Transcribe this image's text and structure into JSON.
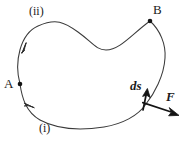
{
  "figure": {
    "background_color": "#ffffff",
    "stroke_color": "#3a3a3a",
    "ink_color": "#1a1a1a",
    "width": 190,
    "height": 142,
    "labels": {
      "point_a": "A",
      "point_b": "B",
      "path_lower": "(i)",
      "path_upper": "(ii)",
      "vector_ds": "ds",
      "vector_force": "F"
    },
    "points": {
      "a": {
        "x": 20,
        "y": 84
      },
      "b": {
        "x": 150,
        "y": 21
      }
    },
    "geometry": {
      "upper_path": "M 20 84 C 14 62 20 34 38 26 C 56 18 64 22 78 32 C 92 42 96 50 106 50 C 120 50 132 34 150 21",
      "lower_path": "M 20 84 C 22 98 26 112 40 120 C 60 131 84 130 104 127 C 122 124 138 116 146 104",
      "right_path": "M 150 21 C 160 30 166 44 165 58 C 164 76 154 94 146 104",
      "arrow_upper_tip": {
        "x": 26,
        "y": 44
      },
      "arrow_lower_tip": {
        "x": 33,
        "y": 107
      },
      "ds_arrow": {
        "x1": 143,
        "y1": 110,
        "x2": 147,
        "y2": 91
      },
      "f_arrow": {
        "x1": 143,
        "y1": 103,
        "x2": 178,
        "y2": 115
      }
    }
  }
}
